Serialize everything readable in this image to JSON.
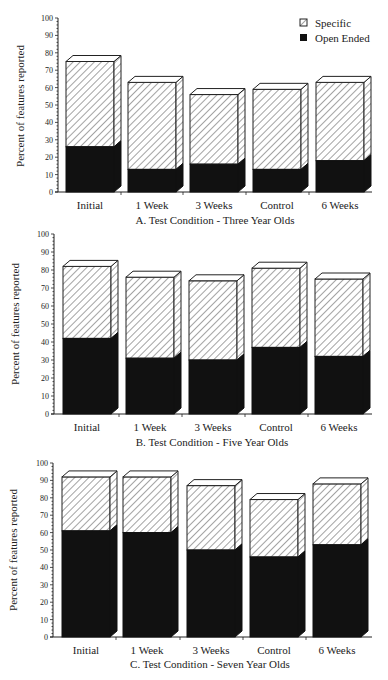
{
  "legend": {
    "items": [
      {
        "label": "Specific",
        "pattern": "hatched"
      },
      {
        "label": "Open Ended",
        "pattern": "solid-black"
      }
    ]
  },
  "colors": {
    "open_ended": "#111111",
    "specific_fill": "#ffffff",
    "hatch": "#333333",
    "axis": "#222222"
  },
  "chart_data": [
    {
      "type": "bar",
      "stacked": true,
      "style": "3d",
      "title": "A. Test Condition - Three Year Olds",
      "xlabel": "",
      "ylabel": "Percent of features reported",
      "ylim": [
        0,
        100
      ],
      "yticks": [
        0,
        10,
        20,
        30,
        40,
        50,
        60,
        70,
        80,
        90,
        100
      ],
      "grid": false,
      "legend_position": "top-right",
      "categories": [
        "Initial",
        "1 Week",
        "3 Weeks",
        "Control",
        "6 Weeks"
      ],
      "series": [
        {
          "name": "Open Ended",
          "values": [
            26,
            13,
            16,
            13,
            18
          ]
        },
        {
          "name": "Specific",
          "values": [
            49,
            50,
            40,
            46,
            45
          ]
        }
      ],
      "totals": [
        75,
        63,
        56,
        59,
        63
      ]
    },
    {
      "type": "bar",
      "stacked": true,
      "style": "3d",
      "title": "B. Test Condition - Five Year Olds",
      "xlabel": "",
      "ylabel": "Percent of features reported",
      "ylim": [
        0,
        100
      ],
      "yticks": [
        0,
        10,
        20,
        30,
        40,
        50,
        60,
        70,
        80,
        90,
        100
      ],
      "grid": false,
      "categories": [
        "Initial",
        "1 Week",
        "3 Weeks",
        "Control",
        "6 Weeks"
      ],
      "series": [
        {
          "name": "Open Ended",
          "values": [
            42,
            31,
            30,
            37,
            32
          ]
        },
        {
          "name": "Specific",
          "values": [
            40,
            45,
            44,
            44,
            43
          ]
        }
      ],
      "totals": [
        82,
        76,
        74,
        81,
        75
      ]
    },
    {
      "type": "bar",
      "stacked": true,
      "style": "3d",
      "title": "C. Test Condition - Seven Year Olds",
      "xlabel": "",
      "ylabel": "Percent of features reported",
      "ylim": [
        0,
        100
      ],
      "yticks": [
        0,
        10,
        20,
        30,
        40,
        50,
        60,
        70,
        80,
        90,
        100
      ],
      "grid": false,
      "categories": [
        "Initial",
        "1 Week",
        "3 Weeks",
        "Control",
        "6 Weeks"
      ],
      "series": [
        {
          "name": "Open Ended",
          "values": [
            61,
            60,
            50,
            46,
            53
          ]
        },
        {
          "name": "Specific",
          "values": [
            31,
            32,
            37,
            33,
            35
          ]
        }
      ],
      "totals": [
        92,
        92,
        87,
        79,
        88
      ]
    }
  ]
}
